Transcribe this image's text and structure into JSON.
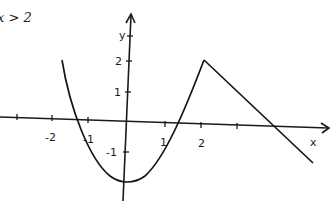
{
  "header": {
    "condition_text": "x > 2"
  },
  "axes": {
    "x_label": "x",
    "y_label": "y",
    "x_ticks": [
      "-2",
      "-1",
      "1",
      "2"
    ],
    "y_ticks": [
      "2",
      "1",
      "-1"
    ]
  },
  "graph": {
    "description": "Piecewise function: parabola from about x=-2.5 opening upward with vertex near (0,-2), rising to (2,2), then a straight line decreasing for x > 2, crossing the x-axis near x=4",
    "pieces": [
      {
        "type": "parabola",
        "domain": "-2.5 <= x <= 2",
        "vertex": [
          0,
          -2
        ],
        "end_point": [
          2,
          2
        ]
      },
      {
        "type": "line",
        "domain": "x > 2",
        "start_point": [
          2,
          2
        ],
        "x_intercept": 4
      }
    ]
  }
}
